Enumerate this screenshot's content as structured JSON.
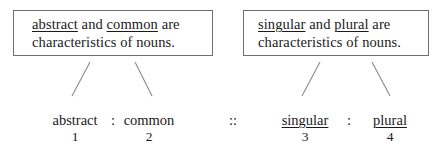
{
  "figure": {
    "background_color": "#ffffff",
    "text_color": "#1a1a1a",
    "border_color": "#6f6f6f",
    "line_color": "#8a8a8a"
  },
  "boxes": [
    {
      "id": "left-premise-box",
      "line1": {
        "term_a": "abstract",
        "conjunction": " and ",
        "term_b": "common",
        "tail": " are"
      },
      "line2": "characteristics of nouns."
    },
    {
      "id": "right-premise-box",
      "line1": {
        "term_a": "singular",
        "conjunction": " and ",
        "term_b": "plural",
        "tail": " are"
      },
      "line2": "characteristics of nouns."
    }
  ],
  "analogy": {
    "pair_separator": ":",
    "ratio_separator": "::",
    "terms": [
      {
        "label": "abstract",
        "number": "1",
        "underlined": false
      },
      {
        "label": "common",
        "number": "2",
        "underlined": false
      },
      {
        "label": "singular",
        "number": "3",
        "underlined": true
      },
      {
        "label": "plural",
        "number": "4",
        "underlined": true
      }
    ]
  }
}
